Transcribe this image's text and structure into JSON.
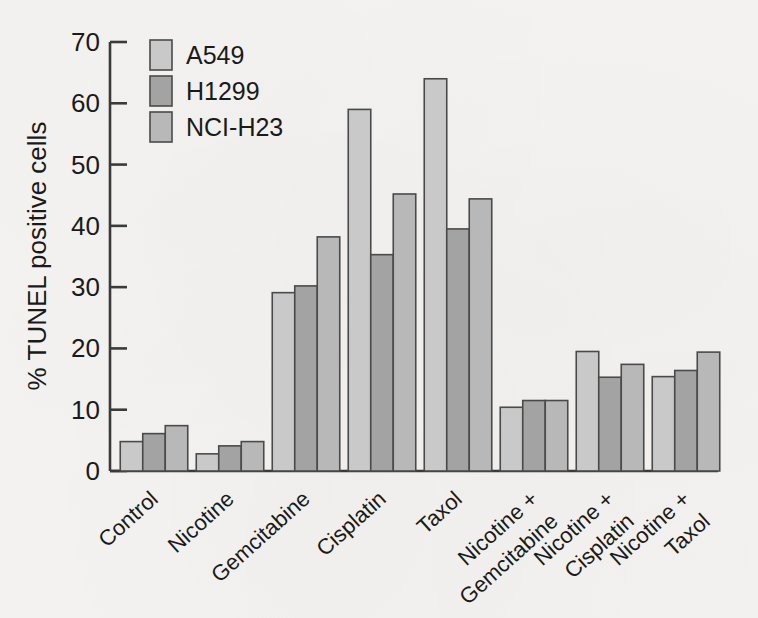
{
  "figure": {
    "background_color": "#f4f3f1",
    "axis_color": "#3a3a3a",
    "bar_outline_color": "#4a4a4a"
  },
  "chart_data": {
    "type": "bar",
    "title": "",
    "xlabel": "",
    "ylabel": "% TUNEL positive cells",
    "ylim": [
      0,
      70
    ],
    "yticks": [
      0,
      10,
      20,
      30,
      40,
      50,
      60,
      70
    ],
    "ytick_labels": [
      "0",
      "10",
      "20",
      "30",
      "40",
      "50",
      "60",
      "70"
    ],
    "grid": false,
    "legend_position": "top-left",
    "categories": [
      "Control",
      "Nicotine",
      "Gemcitabine",
      "Cisplatin",
      "Taxol",
      "Nicotine +\nGemcitabine",
      "Nicotine +\nCisplatin",
      "Nicotine +\nTaxol"
    ],
    "category_lines": [
      [
        "Control"
      ],
      [
        "Nicotine"
      ],
      [
        "Gemcitabine"
      ],
      [
        "Cisplatin"
      ],
      [
        "Taxol"
      ],
      [
        "Nicotine +",
        "Gemcitabine"
      ],
      [
        "Nicotine +",
        "Cisplatin"
      ],
      [
        "Nicotine +",
        "Taxol"
      ]
    ],
    "series": [
      {
        "name": "A549",
        "color": "#c9c9c9",
        "values": [
          4.8,
          2.8,
          29.1,
          59.0,
          64.0,
          10.4,
          19.5,
          15.4
        ]
      },
      {
        "name": "H1299",
        "color": "#a3a3a3",
        "values": [
          6.1,
          4.1,
          30.2,
          35.3,
          39.5,
          11.5,
          15.3,
          16.4
        ]
      },
      {
        "name": "NCI-H23",
        "color": "#b8b8b8",
        "values": [
          7.4,
          4.8,
          38.2,
          45.2,
          44.4,
          11.5,
          17.4,
          19.4
        ]
      }
    ]
  }
}
